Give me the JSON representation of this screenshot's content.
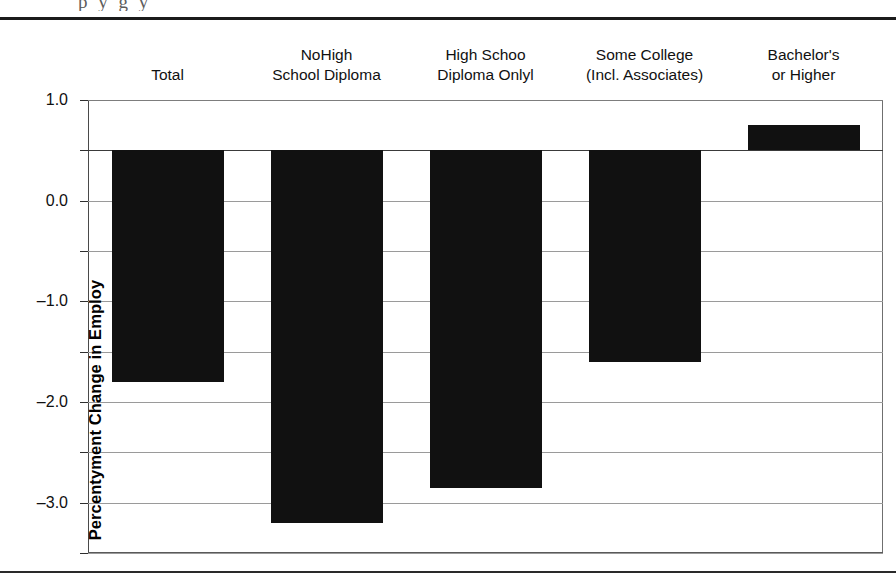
{
  "page": {
    "title_fragment": "p y    g  y"
  },
  "chart_data": {
    "type": "bar",
    "title": "",
    "xlabel": "",
    "ylabel": "Percentyment Change in Employ",
    "categories": [
      "Total",
      "NoHigh School Diploma",
      "High Schoo Diploma Onlyl",
      "Some College (Incl. Associates)",
      "Bachelor's or Higher"
    ],
    "category_lines": [
      {
        "line1": "",
        "line2": "Total"
      },
      {
        "line1": "NoHigh",
        "line2": "School Diploma"
      },
      {
        "line1": "High Schoo",
        "line2": "Diploma Onlyl"
      },
      {
        "line1": "Some College",
        "line2": "(Incl. Associates)"
      },
      {
        "line1": "Bachelor's",
        "line2": "or Higher"
      }
    ],
    "values": [
      -4.6,
      -7.4,
      -6.7,
      -4.2,
      0.5
    ],
    "ylim": [
      -8.0,
      1.0
    ],
    "ytick_labels": [
      "1.0",
      "0.0",
      "–1.0",
      "–2.0",
      "–3.0",
      "–4.0",
      "–5.0",
      "–6.0",
      "–7.0",
      "–8.0"
    ],
    "ytick_values": [
      1.0,
      0.0,
      -1.0,
      -2.0,
      -3.0,
      -4.0,
      -5.0,
      -6.0,
      -7.0,
      -8.0
    ],
    "grid": true,
    "legend": "none",
    "bar_color": "#111111",
    "grid_color": "#9a9a9a",
    "axis_color": "#3a3a3a"
  }
}
